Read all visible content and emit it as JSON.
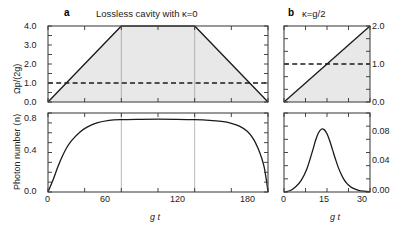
{
  "figure": {
    "panel_a_label": "a",
    "panel_b_label": "b",
    "panel_a_title": "Lossless cavity with  κ=0",
    "panel_b_title": "κ=g/2"
  },
  "axes": {
    "top_left_ylabel": "Ωp/(2g)",
    "bottom_left_ylabel": "Photon number ⟨n⟩",
    "xlabel_a": "g t",
    "xlabel_b": "g t",
    "a_top_yticks": [
      "0.0",
      "1.0",
      "2.0",
      "3.0",
      "4.0"
    ],
    "a_bottom_yticks": [
      "0.0",
      "0.4",
      "0.8"
    ],
    "a_xticks": [
      "0",
      "60",
      "120",
      "180"
    ],
    "b_top_yticks": [
      "0.0",
      "1.0",
      "2.0"
    ],
    "b_bottom_yticks": [
      "0.00",
      "0.04",
      "0.08"
    ],
    "b_xticks": [
      "0",
      "15",
      "30"
    ]
  },
  "colors": {
    "line": "#1a1a1a",
    "fill": "#e8e8e8",
    "grid": "#9a9a9a",
    "frame": "#555555"
  },
  "chart_data": [
    {
      "type": "line",
      "id": "panel-a-top",
      "title": "Lossless cavity with κ=0",
      "xlabel": "g t",
      "ylabel": "Ωp/(2g)",
      "xlim": [
        0,
        180
      ],
      "ylim": [
        0,
        4.0
      ],
      "grid": true,
      "series": [
        {
          "name": "drive amplitude (trapezoid)",
          "style": "solid",
          "fill": true,
          "x": [
            0,
            60,
            120,
            180
          ],
          "values": [
            0.0,
            4.0,
            4.0,
            0.0
          ]
        },
        {
          "name": "threshold",
          "style": "dashed",
          "x": [
            0,
            180
          ],
          "values": [
            1.0,
            1.0
          ]
        }
      ]
    },
    {
      "type": "line",
      "id": "panel-a-bottom",
      "xlabel": "g t",
      "ylabel": "Photon number ⟨n⟩",
      "xlim": [
        0,
        180
      ],
      "ylim": [
        0,
        0.95
      ],
      "grid": true,
      "series": [
        {
          "name": "photon number",
          "style": "solid",
          "x": [
            0,
            4,
            8,
            12,
            16,
            20,
            26,
            32,
            40,
            50,
            60,
            75,
            90,
            105,
            120,
            132,
            142,
            150,
            157,
            163,
            168,
            172,
            175,
            177,
            179,
            180
          ],
          "values": [
            0.0,
            0.14,
            0.3,
            0.44,
            0.55,
            0.63,
            0.72,
            0.78,
            0.83,
            0.86,
            0.87,
            0.874,
            0.876,
            0.874,
            0.87,
            0.862,
            0.848,
            0.826,
            0.79,
            0.73,
            0.64,
            0.52,
            0.4,
            0.29,
            0.11,
            0.0
          ]
        }
      ]
    },
    {
      "type": "line",
      "id": "panel-b-top",
      "title": "κ=g/2",
      "xlabel": "g t",
      "ylabel": "Ωp/(2g)",
      "xlim": [
        0,
        30
      ],
      "ylim": [
        0,
        2.0
      ],
      "grid": false,
      "series": [
        {
          "name": "drive amplitude (ramp)",
          "style": "solid",
          "fill": true,
          "x": [
            0,
            30
          ],
          "values": [
            0.0,
            2.0
          ]
        },
        {
          "name": "threshold",
          "style": "dashed",
          "x": [
            0,
            30
          ],
          "values": [
            1.0,
            1.0
          ]
        }
      ]
    },
    {
      "type": "line",
      "id": "panel-b-bottom",
      "xlabel": "g t",
      "ylabel": "Photon number ⟨n⟩",
      "xlim": [
        0,
        30
      ],
      "ylim": [
        0,
        0.095
      ],
      "grid": false,
      "series": [
        {
          "name": "photon number",
          "style": "solid",
          "x": [
            0,
            2,
            4,
            6,
            8,
            10,
            11,
            12,
            13,
            14,
            15,
            16,
            17,
            18,
            19,
            20,
            21,
            22,
            23,
            24,
            26,
            28,
            30
          ],
          "values": [
            0.0,
            0.0015,
            0.006,
            0.014,
            0.028,
            0.05,
            0.062,
            0.071,
            0.0755,
            0.075,
            0.07,
            0.061,
            0.05,
            0.039,
            0.029,
            0.021,
            0.0145,
            0.01,
            0.0068,
            0.0046,
            0.002,
            0.0009,
            0.0004
          ]
        }
      ]
    }
  ]
}
